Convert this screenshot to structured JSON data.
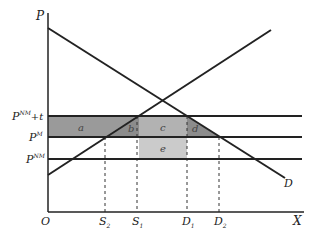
{
  "diagram": {
    "type": "supply-demand tariff diagram",
    "axes": {
      "y_label": "P",
      "x_label": "X",
      "origin_label": "O"
    },
    "curves": {
      "demand_label": "D"
    },
    "price_levels": [
      {
        "label": "P",
        "sup": "NM",
        "suffix": "+t"
      },
      {
        "label": "P",
        "sup": "M",
        "suffix": ""
      },
      {
        "label": "P",
        "sup": "NM",
        "suffix": ""
      }
    ],
    "quantity_marks": [
      {
        "label": "S",
        "sub": "2"
      },
      {
        "label": "S",
        "sub": "1"
      },
      {
        "label": "D",
        "sub": "1"
      },
      {
        "label": "D",
        "sub": "2"
      }
    ],
    "regions": [
      {
        "label": "a",
        "color": "#9a9a9a"
      },
      {
        "label": "b",
        "color": "#8c8c8c"
      },
      {
        "label": "c",
        "color": "#b2b2b2"
      },
      {
        "label": "d",
        "color": "#8c8c8c"
      },
      {
        "label": "e",
        "color": "#cbcbcb"
      }
    ]
  }
}
